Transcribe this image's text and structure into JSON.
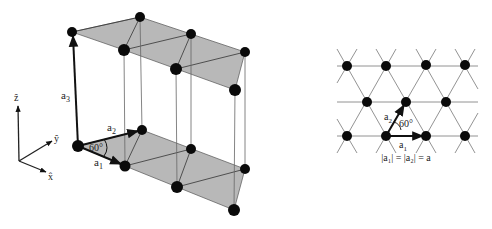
{
  "figure": {
    "left_panel": {
      "title": "3D hexagonal lattice unit cell",
      "axes": {
        "z": "ẑ",
        "y": "ŷ",
        "x": "x̂"
      },
      "vectors": {
        "a1": "a",
        "a1_sub": "1",
        "a2": "a",
        "a2_sub": "2",
        "a3": "a",
        "a3_sub": "3"
      },
      "angle": "60°",
      "plane_fill": "#b8b8b8",
      "atom_color": "#0a0a0a"
    },
    "right_panel": {
      "title": "2D triangular lattice",
      "vectors": {
        "a1": "a",
        "a1_sub": "1",
        "a2": "a",
        "a2_sub": "2"
      },
      "angle": "60°",
      "caption": "|a₁| = |a₂| = a"
    }
  }
}
